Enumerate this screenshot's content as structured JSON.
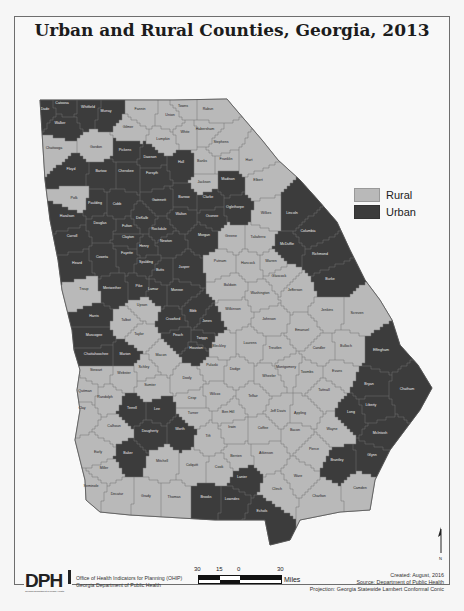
{
  "title": "Urban and Rural Counties, Georgia, 2013",
  "legend": {
    "items": [
      {
        "label": "Rural",
        "color": "#b9b9b9"
      },
      {
        "label": "Urban",
        "color": "#3c3c3c"
      }
    ]
  },
  "colors": {
    "rural": "#b9b9b9",
    "urban": "#3c3c3c",
    "border": "#707070",
    "frame": "#6e6e6e"
  },
  "footer": {
    "logo_text": "DPH",
    "logo_subtext": "Georgia Department of Public Health",
    "org_line1": "Office of Health Indicators for Planning (OHIP)",
    "org_line2": "Georgia Department of Public Health",
    "scale": {
      "ticks": [
        "30",
        "15",
        "0",
        "30"
      ],
      "unit": "Miles"
    },
    "created": "Created: August, 2016",
    "source": "Source: Department of Public Health",
    "projection": "Projection: Georgia Statewide Lambert Conformal Conic"
  },
  "north_arrow": {
    "label": "N"
  },
  "counties": [
    {
      "name": "Dade",
      "type": "urban",
      "x": 45,
      "y": 110
    },
    {
      "name": "Catoosa",
      "type": "urban",
      "x": 62,
      "y": 104
    },
    {
      "name": "Whitfield",
      "type": "urban",
      "x": 88,
      "y": 108
    },
    {
      "name": "Murray",
      "type": "urban",
      "x": 106,
      "y": 112
    },
    {
      "name": "Walker",
      "type": "urban",
      "x": 60,
      "y": 124
    },
    {
      "name": "Fannin",
      "type": "rural",
      "x": 140,
      "y": 110
    },
    {
      "name": "Towns",
      "type": "rural",
      "x": 183,
      "y": 107
    },
    {
      "name": "Rabun",
      "type": "rural",
      "x": 208,
      "y": 110
    },
    {
      "name": "Union",
      "type": "rural",
      "x": 170,
      "y": 116
    },
    {
      "name": "Gilmer",
      "type": "rural",
      "x": 128,
      "y": 128
    },
    {
      "name": "White",
      "type": "rural",
      "x": 185,
      "y": 133
    },
    {
      "name": "Habersham",
      "type": "rural",
      "x": 205,
      "y": 130
    },
    {
      "name": "Lumpkin",
      "type": "rural",
      "x": 163,
      "y": 140
    },
    {
      "name": "Stephens",
      "type": "rural",
      "x": 221,
      "y": 143
    },
    {
      "name": "Chattooga",
      "type": "rural",
      "x": 54,
      "y": 149
    },
    {
      "name": "Gordon",
      "type": "rural",
      "x": 96,
      "y": 148
    },
    {
      "name": "Pickens",
      "type": "urban",
      "x": 125,
      "y": 151
    },
    {
      "name": "Dawson",
      "type": "urban",
      "x": 150,
      "y": 158
    },
    {
      "name": "Hall",
      "type": "urban",
      "x": 181,
      "y": 163
    },
    {
      "name": "Banks",
      "type": "rural",
      "x": 202,
      "y": 162
    },
    {
      "name": "Franklin",
      "type": "rural",
      "x": 226,
      "y": 160
    },
    {
      "name": "Hart",
      "type": "rural",
      "x": 249,
      "y": 161
    },
    {
      "name": "Floyd",
      "type": "urban",
      "x": 71,
      "y": 170
    },
    {
      "name": "Bartow",
      "type": "urban",
      "x": 101,
      "y": 172
    },
    {
      "name": "Cherokee",
      "type": "urban",
      "x": 126,
      "y": 172
    },
    {
      "name": "Forsyth",
      "type": "urban",
      "x": 152,
      "y": 174
    },
    {
      "name": "Jackson",
      "type": "rural",
      "x": 204,
      "y": 183
    },
    {
      "name": "Madison",
      "type": "urban",
      "x": 228,
      "y": 180
    },
    {
      "name": "Elbert",
      "type": "rural",
      "x": 258,
      "y": 181
    },
    {
      "name": "Polk",
      "type": "rural",
      "x": 74,
      "y": 199
    },
    {
      "name": "Paulding",
      "type": "urban",
      "x": 95,
      "y": 204
    },
    {
      "name": "Cobb",
      "type": "urban",
      "x": 117,
      "y": 205
    },
    {
      "name": "Gwinnett",
      "type": "urban",
      "x": 159,
      "y": 201
    },
    {
      "name": "Barrow",
      "type": "urban",
      "x": 184,
      "y": 198
    },
    {
      "name": "Clarke",
      "type": "urban",
      "x": 208,
      "y": 198
    },
    {
      "name": "Oglethorpe",
      "type": "urban",
      "x": 235,
      "y": 208
    },
    {
      "name": "Wilkes",
      "type": "rural",
      "x": 266,
      "y": 214
    },
    {
      "name": "Lincoln",
      "type": "urban",
      "x": 292,
      "y": 214
    },
    {
      "name": "Haralson",
      "type": "urban",
      "x": 67,
      "y": 217
    },
    {
      "name": "Douglas",
      "type": "urban",
      "x": 100,
      "y": 224
    },
    {
      "name": "Fulton",
      "type": "urban",
      "x": 127,
      "y": 227
    },
    {
      "name": "DeKalb",
      "type": "urban",
      "x": 142,
      "y": 219
    },
    {
      "name": "Rockdale",
      "type": "urban",
      "x": 159,
      "y": 230
    },
    {
      "name": "Walton",
      "type": "urban",
      "x": 181,
      "y": 215
    },
    {
      "name": "Oconee",
      "type": "urban",
      "x": 212,
      "y": 217
    },
    {
      "name": "Columbia",
      "type": "urban",
      "x": 308,
      "y": 232
    },
    {
      "name": "Carroll",
      "type": "urban",
      "x": 72,
      "y": 237
    },
    {
      "name": "Clayton",
      "type": "urban",
      "x": 128,
      "y": 238
    },
    {
      "name": "Henry",
      "type": "urban",
      "x": 144,
      "y": 247
    },
    {
      "name": "Newton",
      "type": "urban",
      "x": 166,
      "y": 242
    },
    {
      "name": "Morgan",
      "type": "urban",
      "x": 204,
      "y": 236
    },
    {
      "name": "Greene",
      "type": "rural",
      "x": 231,
      "y": 237
    },
    {
      "name": "Taliaferro",
      "type": "rural",
      "x": 258,
      "y": 238
    },
    {
      "name": "McDuffie",
      "type": "urban",
      "x": 287,
      "y": 245
    },
    {
      "name": "Richmond",
      "type": "urban",
      "x": 320,
      "y": 255
    },
    {
      "name": "Coweta",
      "type": "urban",
      "x": 102,
      "y": 258
    },
    {
      "name": "Fayette",
      "type": "urban",
      "x": 127,
      "y": 254
    },
    {
      "name": "Spalding",
      "type": "urban",
      "x": 146,
      "y": 263
    },
    {
      "name": "Butts",
      "type": "urban",
      "x": 160,
      "y": 271
    },
    {
      "name": "Jasper",
      "type": "urban",
      "x": 184,
      "y": 268
    },
    {
      "name": "Putnam",
      "type": "rural",
      "x": 220,
      "y": 262
    },
    {
      "name": "Hancock",
      "type": "rural",
      "x": 248,
      "y": 264
    },
    {
      "name": "Warren",
      "type": "rural",
      "x": 271,
      "y": 262
    },
    {
      "name": "Heard",
      "type": "urban",
      "x": 77,
      "y": 264
    },
    {
      "name": "Glascock",
      "type": "rural",
      "x": 279,
      "y": 277
    },
    {
      "name": "Burke",
      "type": "urban",
      "x": 330,
      "y": 280
    },
    {
      "name": "Troup",
      "type": "rural",
      "x": 84,
      "y": 290
    },
    {
      "name": "Meriwether",
      "type": "urban",
      "x": 112,
      "y": 289
    },
    {
      "name": "Pike",
      "type": "urban",
      "x": 139,
      "y": 287
    },
    {
      "name": "Lamar",
      "type": "urban",
      "x": 153,
      "y": 290
    },
    {
      "name": "Monroe",
      "type": "urban",
      "x": 177,
      "y": 291
    },
    {
      "name": "Baldwin",
      "type": "rural",
      "x": 230,
      "y": 286
    },
    {
      "name": "Washington",
      "type": "rural",
      "x": 260,
      "y": 294
    },
    {
      "name": "Jefferson",
      "type": "rural",
      "x": 295,
      "y": 291
    },
    {
      "name": "Upson",
      "type": "rural",
      "x": 142,
      "y": 306
    },
    {
      "name": "Harris",
      "type": "urban",
      "x": 94,
      "y": 317
    },
    {
      "name": "Talbot",
      "type": "rural",
      "x": 126,
      "y": 321
    },
    {
      "name": "Crawford",
      "type": "urban",
      "x": 173,
      "y": 320
    },
    {
      "name": "Bibb",
      "type": "urban",
      "x": 193,
      "y": 312
    },
    {
      "name": "Jones",
      "type": "urban",
      "x": 207,
      "y": 322
    },
    {
      "name": "Wilkinson",
      "type": "rural",
      "x": 233,
      "y": 310
    },
    {
      "name": "Johnson",
      "type": "rural",
      "x": 269,
      "y": 320
    },
    {
      "name": "Jenkins",
      "type": "rural",
      "x": 327,
      "y": 311
    },
    {
      "name": "Screven",
      "type": "rural",
      "x": 357,
      "y": 314
    },
    {
      "name": "Muscogee",
      "type": "urban",
      "x": 94,
      "y": 336
    },
    {
      "name": "Taylor",
      "type": "rural",
      "x": 139,
      "y": 335
    },
    {
      "name": "Peach",
      "type": "urban",
      "x": 178,
      "y": 336
    },
    {
      "name": "Twiggs",
      "type": "urban",
      "x": 202,
      "y": 339
    },
    {
      "name": "Laurens",
      "type": "rural",
      "x": 250,
      "y": 344
    },
    {
      "name": "Emanuel",
      "type": "rural",
      "x": 302,
      "y": 331
    },
    {
      "name": "Chattahoochee",
      "type": "urban",
      "x": 96,
      "y": 355
    },
    {
      "name": "Marion",
      "type": "urban",
      "x": 125,
      "y": 355
    },
    {
      "name": "Macon",
      "type": "rural",
      "x": 161,
      "y": 356
    },
    {
      "name": "Houston",
      "type": "urban",
      "x": 196,
      "y": 349
    },
    {
      "name": "Bleckley",
      "type": "rural",
      "x": 219,
      "y": 347
    },
    {
      "name": "Treutlen",
      "type": "rural",
      "x": 275,
      "y": 349
    },
    {
      "name": "Candler",
      "type": "rural",
      "x": 319,
      "y": 349
    },
    {
      "name": "Bulloch",
      "type": "rural",
      "x": 346,
      "y": 347
    },
    {
      "name": "Effingham",
      "type": "urban",
      "x": 381,
      "y": 351
    },
    {
      "name": "Schley",
      "type": "rural",
      "x": 144,
      "y": 368
    },
    {
      "name": "Pulaski",
      "type": "rural",
      "x": 212,
      "y": 366
    },
    {
      "name": "Dodge",
      "type": "rural",
      "x": 235,
      "y": 370
    },
    {
      "name": "Montgomery",
      "type": "rural",
      "x": 286,
      "y": 368
    },
    {
      "name": "Toombs",
      "type": "rural",
      "x": 307,
      "y": 373
    },
    {
      "name": "Evans",
      "type": "rural",
      "x": 337,
      "y": 372
    },
    {
      "name": "Stewart",
      "type": "rural",
      "x": 96,
      "y": 371
    },
    {
      "name": "Webster",
      "type": "rural",
      "x": 124,
      "y": 374
    },
    {
      "name": "Sumter",
      "type": "rural",
      "x": 150,
      "y": 386
    },
    {
      "name": "Dooly",
      "type": "rural",
      "x": 187,
      "y": 379
    },
    {
      "name": "Wheeler",
      "type": "rural",
      "x": 269,
      "y": 377
    },
    {
      "name": "Tattnall",
      "type": "rural",
      "x": 324,
      "y": 391
    },
    {
      "name": "Bryan",
      "type": "urban",
      "x": 369,
      "y": 385
    },
    {
      "name": "Chatham",
      "type": "urban",
      "x": 407,
      "y": 390
    },
    {
      "name": "Quitman",
      "type": "rural",
      "x": 85,
      "y": 392
    },
    {
      "name": "Randolph",
      "type": "rural",
      "x": 105,
      "y": 398
    },
    {
      "name": "Crisp",
      "type": "rural",
      "x": 192,
      "y": 399
    },
    {
      "name": "Wilcox",
      "type": "rural",
      "x": 215,
      "y": 395
    },
    {
      "name": "Telfair",
      "type": "rural",
      "x": 253,
      "y": 397
    },
    {
      "name": "Liberty",
      "type": "urban",
      "x": 371,
      "y": 406
    },
    {
      "name": "Long",
      "type": "urban",
      "x": 351,
      "y": 413
    },
    {
      "name": "Clay",
      "type": "rural",
      "x": 82,
      "y": 409
    },
    {
      "name": "Terrell",
      "type": "urban",
      "x": 132,
      "y": 409
    },
    {
      "name": "Lee",
      "type": "urban",
      "x": 157,
      "y": 410
    },
    {
      "name": "Turner",
      "type": "rural",
      "x": 193,
      "y": 414
    },
    {
      "name": "Ben Hill",
      "type": "rural",
      "x": 228,
      "y": 413
    },
    {
      "name": "Jeff Davis",
      "type": "rural",
      "x": 278,
      "y": 412
    },
    {
      "name": "Appling",
      "type": "rural",
      "x": 300,
      "y": 414
    },
    {
      "name": "McIntosh",
      "type": "urban",
      "x": 380,
      "y": 434
    },
    {
      "name": "Calhoun",
      "type": "rural",
      "x": 114,
      "y": 427
    },
    {
      "name": "Dougherty",
      "type": "urban",
      "x": 150,
      "y": 432
    },
    {
      "name": "Worth",
      "type": "urban",
      "x": 180,
      "y": 430
    },
    {
      "name": "Irwin",
      "type": "rural",
      "x": 232,
      "y": 428
    },
    {
      "name": "Tift",
      "type": "rural",
      "x": 208,
      "y": 437
    },
    {
      "name": "Coffee",
      "type": "rural",
      "x": 263,
      "y": 429
    },
    {
      "name": "Bacon",
      "type": "rural",
      "x": 295,
      "y": 431
    },
    {
      "name": "Wayne",
      "type": "rural",
      "x": 332,
      "y": 430
    },
    {
      "name": "Glynn",
      "type": "urban",
      "x": 372,
      "y": 456
    },
    {
      "name": "Early",
      "type": "rural",
      "x": 98,
      "y": 453
    },
    {
      "name": "Baker",
      "type": "urban",
      "x": 128,
      "y": 454
    },
    {
      "name": "Mitchell",
      "type": "rural",
      "x": 162,
      "y": 462
    },
    {
      "name": "Colquitt",
      "type": "rural",
      "x": 192,
      "y": 466
    },
    {
      "name": "Berrien",
      "type": "rural",
      "x": 236,
      "y": 457
    },
    {
      "name": "Atkinson",
      "type": "rural",
      "x": 266,
      "y": 454
    },
    {
      "name": "Pierce",
      "type": "rural",
      "x": 314,
      "y": 450
    },
    {
      "name": "Brantley",
      "type": "urban",
      "x": 337,
      "y": 461
    },
    {
      "name": "Miller",
      "type": "rural",
      "x": 104,
      "y": 469
    },
    {
      "name": "Cook",
      "type": "rural",
      "x": 219,
      "y": 468
    },
    {
      "name": "Lanier",
      "type": "urban",
      "x": 242,
      "y": 478
    },
    {
      "name": "Ware",
      "type": "rural",
      "x": 298,
      "y": 477
    },
    {
      "name": "Camden",
      "type": "rural",
      "x": 360,
      "y": 489
    },
    {
      "name": "Seminole",
      "type": "rural",
      "x": 91,
      "y": 487
    },
    {
      "name": "Decatur",
      "type": "rural",
      "x": 117,
      "y": 495
    },
    {
      "name": "Grady",
      "type": "rural",
      "x": 146,
      "y": 497
    },
    {
      "name": "Thomas",
      "type": "rural",
      "x": 174,
      "y": 498
    },
    {
      "name": "Brooks",
      "type": "urban",
      "x": 206,
      "y": 498
    },
    {
      "name": "Lowndes",
      "type": "urban",
      "x": 232,
      "y": 500
    },
    {
      "name": "Echols",
      "type": "urban",
      "x": 262,
      "y": 512
    },
    {
      "name": "Clinch",
      "type": "rural",
      "x": 277,
      "y": 490
    },
    {
      "name": "Charlton",
      "type": "rural",
      "x": 319,
      "y": 497
    }
  ]
}
